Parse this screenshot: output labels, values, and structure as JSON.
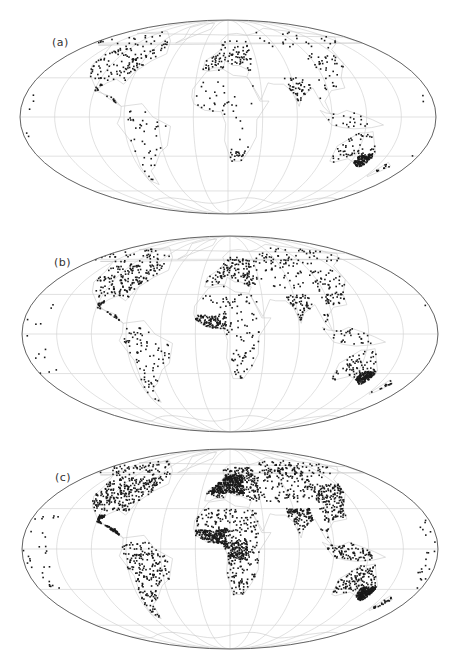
{
  "figure": {
    "projection": "Mollweide",
    "graticule": {
      "meridian_step_deg": 30,
      "parallels_deg": [
        -60,
        -30,
        0,
        30,
        60
      ]
    },
    "colors": {
      "outline": "#555555",
      "graticule": "#d4d4d4",
      "coast": "#c8c8c8",
      "dot": "#1a1a1a"
    }
  },
  "panels": [
    {
      "id": "a",
      "label": "(a)",
      "cx": 228,
      "cy": 117,
      "rx": 208,
      "ry": 97,
      "top": 0,
      "label_x": 52,
      "label_y": 36,
      "density": 1.0
    },
    {
      "id": "b",
      "label": "(b)",
      "cx": 230,
      "cy": 334,
      "rx": 208,
      "ry": 98,
      "top": 0,
      "label_x": 54,
      "label_y": 256,
      "density": 1.6
    },
    {
      "id": "c",
      "label": "(c)",
      "cx": 230,
      "cy": 549,
      "rx": 208,
      "ry": 100,
      "top": 0,
      "label_x": 55,
      "label_y": 471,
      "density": 3.2
    }
  ],
  "chart_data": [
    {
      "type": "scatter",
      "title": "(a)",
      "description": "Station locations on Mollweide world map, sparse network",
      "xlabel": "",
      "ylabel": "",
      "grid": true,
      "regions": [
        {
          "name": "North America",
          "lon": [
            -125,
            -65
          ],
          "lat": [
            28,
            55
          ],
          "count": 110
        },
        {
          "name": "Canada/Alaska north",
          "lon": [
            -165,
            -60
          ],
          "lat": [
            55,
            72
          ],
          "count": 30
        },
        {
          "name": "Central America/Caribbean",
          "lon": [
            -105,
            -60
          ],
          "lat": [
            10,
            25
          ],
          "count": 18
        },
        {
          "name": "South America",
          "lon": [
            -78,
            -38
          ],
          "lat": [
            -55,
            5
          ],
          "count": 40
        },
        {
          "name": "Europe",
          "lon": [
            -10,
            40
          ],
          "lat": [
            36,
            62
          ],
          "count": 90
        },
        {
          "name": "Africa",
          "lon": [
            -15,
            40
          ],
          "lat": [
            -35,
            30
          ],
          "count": 35
        },
        {
          "name": "South Africa",
          "lon": [
            17,
            32
          ],
          "lat": [
            -34,
            -24
          ],
          "count": 20
        },
        {
          "name": "India",
          "lon": [
            68,
            90
          ],
          "lat": [
            8,
            30
          ],
          "count": 45
        },
        {
          "name": "East Asia",
          "lon": [
            100,
            145
          ],
          "lat": [
            20,
            50
          ],
          "count": 40
        },
        {
          "name": "SE Asia/Indonesia",
          "lon": [
            95,
            140
          ],
          "lat": [
            -10,
            15
          ],
          "count": 20
        },
        {
          "name": "Australia",
          "lon": [
            113,
            153
          ],
          "lat": [
            -39,
            -12
          ],
          "count": 60
        },
        {
          "name": "SE Australia dense",
          "lon": [
            138,
            152
          ],
          "lat": [
            -39,
            -28
          ],
          "count": 120
        },
        {
          "name": "New Zealand",
          "lon": [
            166,
            178
          ],
          "lat": [
            -46,
            -35
          ],
          "count": 10
        },
        {
          "name": "Pacific islands",
          "lon": [
            -175,
            -140
          ],
          "lat": [
            -30,
            25
          ],
          "count": 8
        },
        {
          "name": "Siberia",
          "lon": [
            60,
            170
          ],
          "lat": [
            55,
            72
          ],
          "count": 25
        }
      ]
    },
    {
      "type": "scatter",
      "title": "(b)",
      "description": "Station locations on Mollweide world map, intermediate network",
      "xlabel": "",
      "ylabel": "",
      "grid": true,
      "regions": [
        {
          "name": "North America",
          "lon": [
            -125,
            -65
          ],
          "lat": [
            28,
            55
          ],
          "count": 160
        },
        {
          "name": "Canada/Alaska north",
          "lon": [
            -165,
            -60
          ],
          "lat": [
            55,
            72
          ],
          "count": 45
        },
        {
          "name": "Central America/Caribbean",
          "lon": [
            -105,
            -60
          ],
          "lat": [
            10,
            25
          ],
          "count": 30
        },
        {
          "name": "South America",
          "lon": [
            -78,
            -38
          ],
          "lat": [
            -55,
            5
          ],
          "count": 80
        },
        {
          "name": "Europe",
          "lon": [
            -10,
            40
          ],
          "lat": [
            36,
            62
          ],
          "count": 120
        },
        {
          "name": "Russia/Central Asia",
          "lon": [
            40,
            100
          ],
          "lat": [
            35,
            65
          ],
          "count": 60
        },
        {
          "name": "West Africa",
          "lon": [
            -15,
            12
          ],
          "lat": [
            4,
            14
          ],
          "count": 90
        },
        {
          "name": "Africa",
          "lon": [
            -15,
            40
          ],
          "lat": [
            -35,
            30
          ],
          "count": 110
        },
        {
          "name": "India",
          "lon": [
            68,
            90
          ],
          "lat": [
            8,
            30
          ],
          "count": 55
        },
        {
          "name": "East Asia",
          "lon": [
            100,
            145
          ],
          "lat": [
            20,
            50
          ],
          "count": 70
        },
        {
          "name": "SE Asia/Indonesia",
          "lon": [
            95,
            140
          ],
          "lat": [
            -10,
            15
          ],
          "count": 35
        },
        {
          "name": "Australia",
          "lon": [
            113,
            153
          ],
          "lat": [
            -39,
            -12
          ],
          "count": 70
        },
        {
          "name": "SE Australia dense",
          "lon": [
            138,
            152
          ],
          "lat": [
            -39,
            -28
          ],
          "count": 160
        },
        {
          "name": "New Zealand",
          "lon": [
            166,
            178
          ],
          "lat": [
            -46,
            -35
          ],
          "count": 12
        },
        {
          "name": "Pacific islands",
          "lon": [
            -175,
            -140
          ],
          "lat": [
            -30,
            25
          ],
          "count": 14
        },
        {
          "name": "Siberia",
          "lon": [
            60,
            170
          ],
          "lat": [
            55,
            72
          ],
          "count": 40
        }
      ]
    },
    {
      "type": "scatter",
      "title": "(c)",
      "description": "Station locations on Mollweide world map, densest network",
      "xlabel": "",
      "ylabel": "",
      "grid": true,
      "regions": [
        {
          "name": "North America",
          "lon": [
            -125,
            -65
          ],
          "lat": [
            28,
            55
          ],
          "count": 260
        },
        {
          "name": "Canada/Alaska north",
          "lon": [
            -165,
            -60
          ],
          "lat": [
            55,
            72
          ],
          "count": 70
        },
        {
          "name": "Central America/Caribbean",
          "lon": [
            -105,
            -60
          ],
          "lat": [
            10,
            25
          ],
          "count": 90
        },
        {
          "name": "South America",
          "lon": [
            -78,
            -38
          ],
          "lat": [
            -55,
            5
          ],
          "count": 200
        },
        {
          "name": "Europe dense",
          "lon": [
            -5,
            30
          ],
          "lat": [
            42,
            58
          ],
          "count": 320
        },
        {
          "name": "Europe",
          "lon": [
            -10,
            45
          ],
          "lat": [
            36,
            65
          ],
          "count": 180
        },
        {
          "name": "Russia/Central Asia",
          "lon": [
            40,
            110
          ],
          "lat": [
            35,
            65
          ],
          "count": 160
        },
        {
          "name": "West Africa",
          "lon": [
            -15,
            12
          ],
          "lat": [
            4,
            14
          ],
          "count": 170
        },
        {
          "name": "Central Africa",
          "lon": [
            8,
            30
          ],
          "lat": [
            -8,
            6
          ],
          "count": 140
        },
        {
          "name": "Africa",
          "lon": [
            -15,
            40
          ],
          "lat": [
            -35,
            30
          ],
          "count": 260
        },
        {
          "name": "India",
          "lon": [
            68,
            90
          ],
          "lat": [
            8,
            30
          ],
          "count": 110
        },
        {
          "name": "East Asia",
          "lon": [
            100,
            145
          ],
          "lat": [
            20,
            50
          ],
          "count": 160
        },
        {
          "name": "SE Asia/Indonesia",
          "lon": [
            95,
            140
          ],
          "lat": [
            -10,
            15
          ],
          "count": 90
        },
        {
          "name": "Australia",
          "lon": [
            113,
            153
          ],
          "lat": [
            -39,
            -12
          ],
          "count": 140
        },
        {
          "name": "SE Australia dense",
          "lon": [
            138,
            152
          ],
          "lat": [
            -39,
            -28
          ],
          "count": 220
        },
        {
          "name": "New Zealand",
          "lon": [
            166,
            178
          ],
          "lat": [
            -46,
            -35
          ],
          "count": 20
        },
        {
          "name": "Pacific islands",
          "lon": [
            -178,
            -140
          ],
          "lat": [
            -30,
            25
          ],
          "count": 50
        },
        {
          "name": "Siberia",
          "lon": [
            60,
            170
          ],
          "lat": [
            55,
            72
          ],
          "count": 70
        }
      ]
    }
  ]
}
